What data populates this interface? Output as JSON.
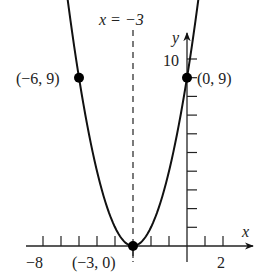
{
  "chart_data": {
    "type": "line",
    "title": "",
    "function": "y = (x + 3)^2",
    "xlabel": "x",
    "ylabel": "y",
    "xlim": [
      -9,
      3.5
    ],
    "ylim": [
      0,
      11.5
    ],
    "grid": false,
    "axis_of_symmetry": {
      "label": "x = −3",
      "x": -3,
      "style": "dashed"
    },
    "x_tick_labels": [
      {
        "value": -8,
        "label": "−8"
      },
      {
        "value": 2,
        "label": "2"
      }
    ],
    "y_tick_labels": [
      {
        "value": 10,
        "label": "10"
      }
    ],
    "x_ticks": [
      -8,
      -7,
      -6,
      -5,
      -4,
      -3,
      -2,
      -1,
      1,
      2
    ],
    "y_ticks": [
      1,
      2,
      3,
      4,
      5,
      6,
      7,
      8,
      9,
      10
    ],
    "points": [
      {
        "x": -6,
        "y": 9,
        "label": "(−6, 9)"
      },
      {
        "x": 0,
        "y": 9,
        "label": "(0, 9)"
      },
      {
        "x": -3,
        "y": 0,
        "label": "(−3, 0)"
      }
    ],
    "series": [
      {
        "name": "parabola",
        "x": [
          -7.08,
          -6,
          -5,
          -4,
          -3,
          -2,
          -1,
          0,
          1.08
        ],
        "values": [
          10.1,
          9,
          4,
          1,
          0,
          1,
          4,
          9,
          10.1
        ]
      }
    ],
    "colors": {
      "curve": "#111111",
      "axes": "#222222",
      "points": "#000000"
    }
  }
}
